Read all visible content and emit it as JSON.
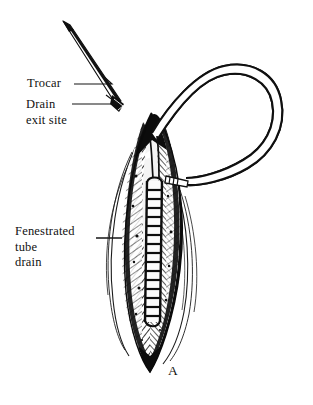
{
  "figure": {
    "panel_letter": "A",
    "background_color": "#ffffff",
    "ink_color": "#111111"
  },
  "labels": {
    "trocar": {
      "text": "Trocar",
      "lines": [
        "Trocar"
      ]
    },
    "drain_exit_site": {
      "text": "Drain exit site",
      "lines": [
        "Drain",
        "exit site"
      ]
    },
    "fenestrated_tube_drain": {
      "text": "Fenestrated tube drain",
      "lines": [
        "Fenestrated",
        "tube",
        "drain"
      ]
    }
  },
  "illustration": {
    "style": "black-and-white pen-and-ink line drawing",
    "elements": [
      "trocar-needle",
      "drain-tube-loop",
      "incision-wound",
      "hatched-tissue",
      "fenestrated-drain-tube",
      "skin-contour-lines"
    ],
    "fenestration_count": 15
  }
}
